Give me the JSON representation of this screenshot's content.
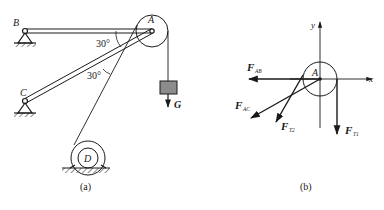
{
  "figure_a": {
    "caption": "(a)",
    "labels": {
      "B": "B",
      "A": "A",
      "C": "C",
      "D": "D",
      "G": "G",
      "angle_top": "30°",
      "angle_bottom": "30°"
    }
  },
  "figure_b": {
    "caption": "(b)",
    "labels": {
      "A": "A",
      "x_axis": "x",
      "y_axis": "y",
      "F_AB_main": "F",
      "F_AB_sub": "AB",
      "F_AC_main": "F",
      "F_AC_sub": "AC",
      "F_T2_main": "F",
      "F_T2_sub": "T2",
      "F_T1_main": "F",
      "F_T1_sub": "T1"
    }
  },
  "colors": {
    "ink": "#1a1a1a",
    "weight_fill": "#8c8c8c",
    "background": "#ffffff"
  }
}
